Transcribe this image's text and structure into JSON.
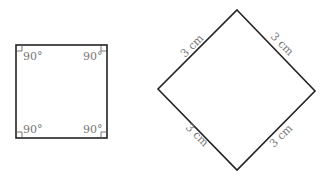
{
  "square": {
    "angles": [
      "90°",
      "90°",
      "90°",
      "90°"
    ]
  },
  "rhombus": {
    "sides": [
      "3 cm",
      "3 cm",
      "3 cm",
      "3 cm"
    ]
  },
  "colors": {
    "stroke": "#222222",
    "label": "#777777"
  }
}
